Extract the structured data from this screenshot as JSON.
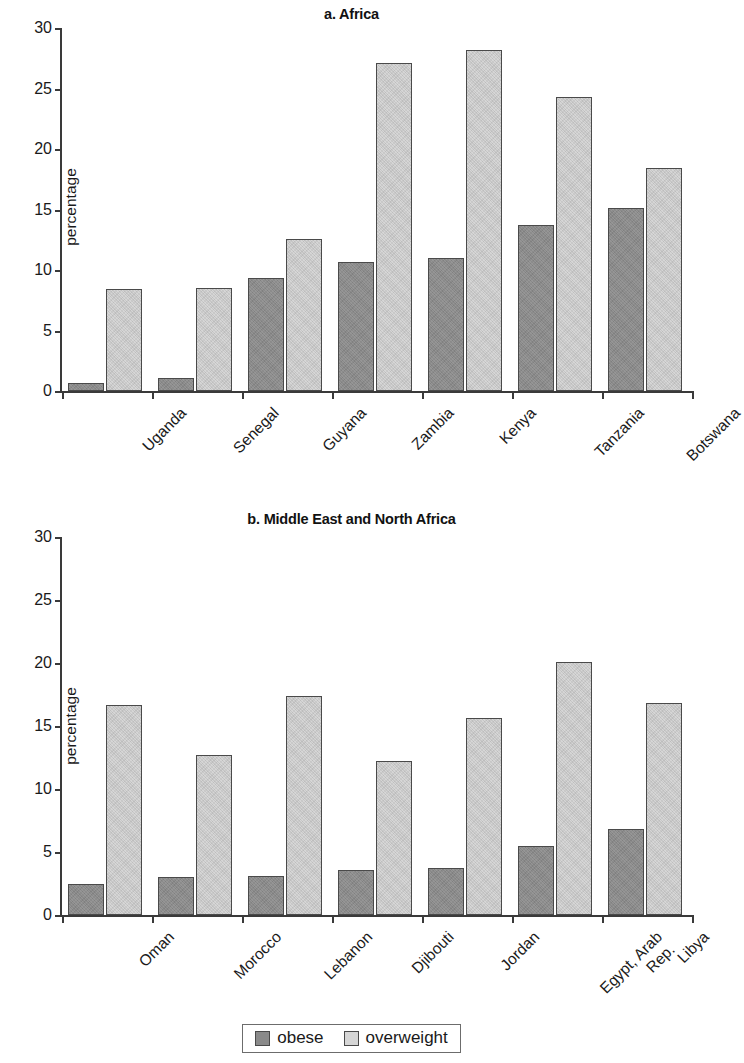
{
  "figure": {
    "legend": {
      "items": [
        {
          "label": "obese",
          "color": "#8a8a8a",
          "swatch_name": "legend-swatch-obese"
        },
        {
          "label": "overweight",
          "color": "#d6d6d6",
          "swatch_name": "legend-swatch-overweight"
        }
      ]
    }
  },
  "chart_data": [
    {
      "type": "bar",
      "title": "a. Africa",
      "xlabel": "",
      "ylabel": "percentage",
      "ylim": [
        0,
        30
      ],
      "yticks": [
        0,
        5,
        10,
        15,
        20,
        25,
        30
      ],
      "ytick_labels": [
        "0",
        "5",
        "10",
        "15",
        "20",
        "25",
        "30"
      ],
      "grid": false,
      "legend_position": "bottom-center (shared)",
      "categories": [
        "Uganda",
        "Senegal",
        "Guyana",
        "Zambia",
        "Kenya",
        "Tanzania",
        "Botswana"
      ],
      "series": [
        {
          "name": "obese",
          "color": "#8a8a8a",
          "values": [
            0.7,
            1.1,
            9.3,
            10.7,
            11.0,
            13.7,
            15.1
          ]
        },
        {
          "name": "overweight",
          "color": "#d6d6d6",
          "values": [
            8.4,
            8.5,
            12.6,
            27.1,
            28.2,
            24.3,
            18.4
          ]
        }
      ]
    },
    {
      "type": "bar",
      "title": "b. Middle East and North Africa",
      "xlabel": "",
      "ylabel": "percentage",
      "ylim": [
        0,
        30
      ],
      "yticks": [
        0,
        5,
        10,
        15,
        20,
        25,
        30
      ],
      "ytick_labels": [
        "0",
        "5",
        "10",
        "15",
        "20",
        "25",
        "30"
      ],
      "grid": false,
      "legend_position": "bottom-center (shared)",
      "categories": [
        "Oman",
        "Morocco",
        "Lebanon",
        "Djibouti",
        "Jordan",
        "Egypt, Arab\nRep.",
        "Libya"
      ],
      "series": [
        {
          "name": "obese",
          "color": "#8a8a8a",
          "values": [
            2.5,
            3.0,
            3.1,
            3.6,
            3.7,
            5.5,
            6.8
          ]
        },
        {
          "name": "overweight",
          "color": "#d6d6d6",
          "values": [
            16.7,
            12.7,
            17.4,
            12.2,
            15.6,
            20.1,
            16.8
          ]
        }
      ]
    }
  ]
}
